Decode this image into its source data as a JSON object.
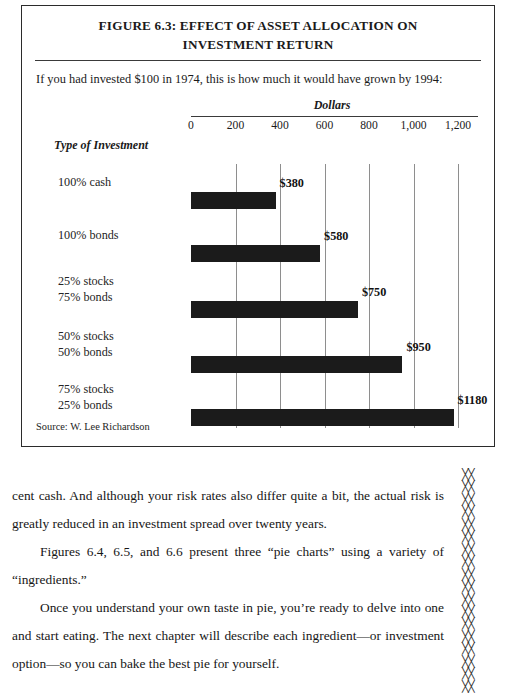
{
  "figure": {
    "title_line1": "FIGURE 6.3: EFFECT OF ASSET ALLOCATION ON",
    "title_line2": "INVESTMENT RETURN",
    "subtitle": "If you had invested $100 in 1974, this is how much it would have grown by 1994:",
    "source": "Source: W. Lee Richardson"
  },
  "chart_data": {
    "type": "bar",
    "orientation": "horizontal",
    "title": "FIGURE 6.3: EFFECT OF ASSET ALLOCATION ON INVESTMENT RETURN",
    "subtitle": "If you had invested $100 in 1974, this is how much it would have grown by 1994:",
    "xlabel": "Dollars",
    "ylabel": "Type of Investment",
    "xlim": [
      0,
      1200
    ],
    "xticks": [
      0,
      200,
      400,
      600,
      800,
      1000,
      1200
    ],
    "xticklabels": [
      "0",
      "200",
      "400",
      "600",
      "800",
      "1,000",
      "1,200"
    ],
    "grid": true,
    "legend": false,
    "bar_color": "#1b1b1b",
    "categories": [
      "100% cash",
      "100% bonds",
      "25% stocks 75% bonds",
      "50% stocks 50% bonds",
      "75% stocks 25% bonds"
    ],
    "values": [
      380,
      580,
      750,
      950,
      1180
    ],
    "value_labels": [
      "$380",
      "$580",
      "$750",
      "$950",
      "$1180"
    ],
    "source": "Source: W. Lee Richardson",
    "bars": [
      {
        "label_line1": "100% cash",
        "label_line2": "",
        "value": 380,
        "value_label": "$380"
      },
      {
        "label_line1": "100% bonds",
        "label_line2": "",
        "value": 580,
        "value_label": "$580"
      },
      {
        "label_line1": "25% stocks",
        "label_line2": "75% bonds",
        "value": 750,
        "value_label": "$750"
      },
      {
        "label_line1": "50% stocks",
        "label_line2": "50% bonds",
        "value": 950,
        "value_label": "$950"
      },
      {
        "label_line1": "75% stocks",
        "label_line2": "25% bonds",
        "value": 1180,
        "value_label": "$1180"
      }
    ]
  },
  "body": {
    "paragraph1": "cent cash. And although your risk rates also differ quite a bit, the actual risk is greatly reduced in an investment spread over twenty years.",
    "paragraph2": "Figures 6.4, 6.5, and 6.6 present three “pie charts” using a variety of “ingredients.”",
    "paragraph3": "Once you understand your own taste in pie, you’re ready to delve into one and start eating. The next chapter will describe each ingredient—or investment option—so you can bake the best pie for yourself."
  },
  "margin": {
    "mark": "╳╳",
    "count": 18
  }
}
